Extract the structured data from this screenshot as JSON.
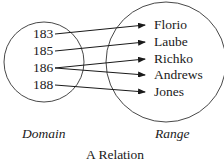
{
  "domain": {
    "label": "Domain",
    "items": [
      "183",
      "185",
      "186",
      "188"
    ]
  },
  "range": {
    "label": "Range",
    "items": [
      "Florio",
      "Laube",
      "Richko",
      "Andrews",
      "Jones"
    ]
  },
  "mappings": [
    {
      "from": "183",
      "to": "Florio"
    },
    {
      "from": "185",
      "to": "Laube"
    },
    {
      "from": "186",
      "to": "Richko"
    },
    {
      "from": "186",
      "to": "Andrews"
    },
    {
      "from": "188",
      "to": "Jones"
    }
  ],
  "caption": "A Relation"
}
